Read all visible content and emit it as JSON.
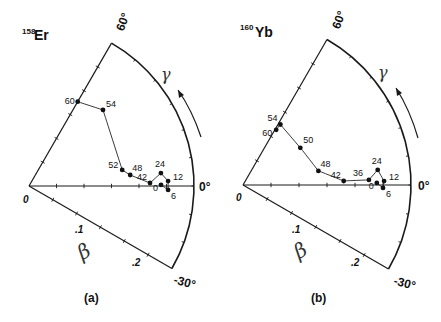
{
  "chart_data": [
    {
      "type": "scatter",
      "subtype": "polar-beta-gamma-trajectory",
      "panel_label": "(a)",
      "nucleus": {
        "mass": "158",
        "symbol": "Er"
      },
      "radial_axis": {
        "label": "β",
        "ticks": [
          ".1",
          ".2"
        ],
        "range": [
          0,
          0.3
        ],
        "origin_label": "0"
      },
      "angular_axis": {
        "label": "γ",
        "range_deg": [
          -30,
          60
        ],
        "tick_labels": [
          "60°",
          "0°",
          "-30°"
        ],
        "direction_arrow": "increasing γ (counter-clockwise)"
      },
      "points": [
        {
          "label": "0",
          "beta": 0.24,
          "gamma": 0.5
        },
        {
          "label": "6",
          "beta": 0.253,
          "gamma": -1.6
        },
        {
          "label": "12",
          "beta": 0.253,
          "gamma": 2.0
        },
        {
          "label": "24",
          "beta": 0.241,
          "gamma": 5.6
        },
        {
          "label": "42",
          "beta": 0.22,
          "gamma": 1.4
        },
        {
          "label": "48",
          "beta": 0.185,
          "gamma": 6.2
        },
        {
          "label": "52",
          "beta": 0.172,
          "gamma": 9.8
        },
        {
          "label": "54",
          "beta": 0.193,
          "gamma": 45.8
        },
        {
          "label": "60",
          "beta": 0.177,
          "gamma": 60.0
        }
      ],
      "note": "Point labels are spin values I (ħ); curve connects points in order of increasing spin"
    },
    {
      "type": "scatter",
      "subtype": "polar-beta-gamma-trajectory",
      "panel_label": "(b)",
      "nucleus": {
        "mass": "160",
        "symbol": "Yb"
      },
      "radial_axis": {
        "label": "β",
        "ticks": [
          ".1",
          ".2"
        ],
        "range": [
          0,
          0.3
        ],
        "origin_label": "0"
      },
      "angular_axis": {
        "label": "γ",
        "range_deg": [
          -30,
          60
        ],
        "tick_labels": [
          "60°",
          "0°",
          "-30°"
        ],
        "direction_arrow": "increasing γ (counter-clockwise)"
      },
      "points": [
        {
          "label": "0",
          "beta": 0.239,
          "gamma": 0.9
        },
        {
          "label": "6",
          "beta": 0.25,
          "gamma": -1.2
        },
        {
          "label": "12",
          "beta": 0.252,
          "gamma": 1.6
        },
        {
          "label": "24",
          "beta": 0.242,
          "gamma": 6.4
        },
        {
          "label": "36",
          "beta": 0.225,
          "gamma": 2.3
        },
        {
          "label": "42",
          "beta": 0.18,
          "gamma": 2.3
        },
        {
          "label": "48",
          "beta": 0.137,
          "gamma": 10.6
        },
        {
          "label": "50",
          "beta": 0.122,
          "gamma": 33.0
        },
        {
          "label": "54",
          "beta": 0.127,
          "gamma": 58.3
        },
        {
          "label": "60",
          "beta": 0.115,
          "gamma": 59.0
        }
      ],
      "note": "Point labels are spin values I (ħ); curve connects points in order of increasing spin"
    }
  ],
  "panels": {
    "a": {
      "label": "(a)",
      "nucleus_mass": "158",
      "nucleus_symbol": "Er",
      "gamma_symbol": "γ",
      "beta_symbol": "β",
      "origin": "0",
      "tick_beta_1": ".1",
      "tick_beta_2": ".2",
      "angle_60": "60°",
      "angle_0": "0°",
      "angle_m30": "-30°"
    },
    "b": {
      "label": "(b)",
      "nucleus_mass": "160",
      "nucleus_symbol": "Yb",
      "gamma_symbol": "γ",
      "beta_symbol": "β",
      "origin": "0",
      "tick_beta_1": ".1",
      "tick_beta_2": ".2",
      "angle_60": "60°",
      "angle_0": "0°",
      "angle_m30": "-30°"
    }
  }
}
